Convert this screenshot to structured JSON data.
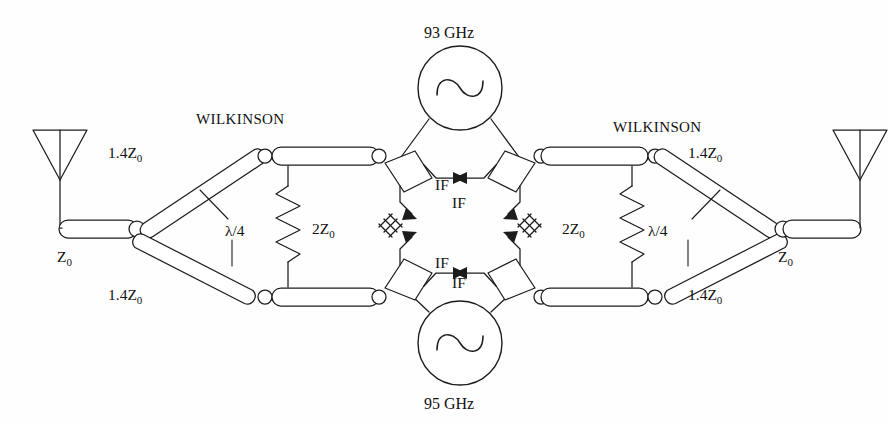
{
  "figure": {
    "kind": "microwave-circuit-schematic",
    "background_color": "#fefefe",
    "line_color": "#1c1c1c"
  },
  "labels": {
    "wilkinson_left": "WILKINSON",
    "wilkinson_right": "WILKINSON",
    "osc_top": "93 GHz",
    "osc_bottom": "95 GHz",
    "z0_left": "Z",
    "z0_left_sub": "0",
    "z0_right": "Z",
    "z0_right_sub": "0",
    "branch_left_top": "1.4Z",
    "branch_left_top_sub": "0",
    "branch_left_bottom": "1.4Z",
    "branch_left_bottom_sub": "0",
    "branch_right_top": "1.4Z",
    "branch_right_top_sub": "0",
    "branch_right_bottom": "1.4Z",
    "branch_right_bottom_sub": "0",
    "resistor_left": "2Z",
    "resistor_left_sub": "0",
    "resistor_right": "2Z",
    "resistor_right_sub": "0",
    "quarter_wave_left": "λ/4",
    "quarter_wave_right": "λ/4",
    "if_top_left": "IF",
    "if_top_right": "IF",
    "if_bottom_left": "IF",
    "if_bottom_right": "IF"
  },
  "components": {
    "antennas": [
      {
        "name": "antenna-left",
        "side": "left"
      },
      {
        "name": "antenna-right",
        "side": "right"
      }
    ],
    "oscillators": [
      {
        "name": "oscillator-93ghz",
        "frequency": "93 GHz",
        "position": "top",
        "symbol": "sine-wave"
      },
      {
        "name": "oscillator-95ghz",
        "frequency": "95 GHz",
        "position": "bottom",
        "symbol": "sine-wave"
      }
    ],
    "dividers": [
      {
        "name": "wilkinson-divider-left",
        "label": "WILKINSON",
        "branch_impedance": "1.4Z0",
        "isolation_resistor": "2Z0",
        "electrical_length": "λ/4"
      },
      {
        "name": "wilkinson-divider-right",
        "label": "WILKINSON",
        "branch_impedance": "1.4Z0",
        "isolation_resistor": "2Z0",
        "electrical_length": "λ/4"
      }
    ],
    "mixers": [
      {
        "name": "mixer-top-left",
        "if_label": "IF"
      },
      {
        "name": "mixer-top-right",
        "if_label": "IF"
      },
      {
        "name": "mixer-bottom-left",
        "if_label": "IF"
      },
      {
        "name": "mixer-bottom-right",
        "if_label": "IF"
      }
    ],
    "feedlines": [
      {
        "name": "feedline-left",
        "impedance": "Z0"
      },
      {
        "name": "feedline-right",
        "impedance": "Z0"
      }
    ],
    "ground_symbols": 4
  }
}
